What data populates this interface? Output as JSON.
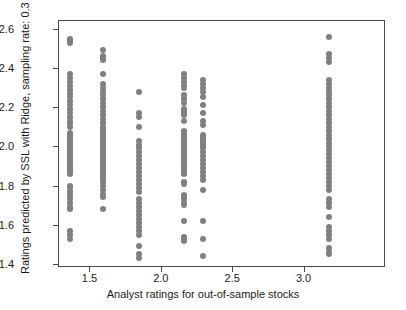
{
  "chart_data": {
    "type": "scatter",
    "title": "",
    "xlabel": "Analyst ratings for out-of-sample stocks",
    "ylabel": "Ratings predicted by SSL with Ridge, sampling rate: 0.3",
    "xlim": [
      1.28,
      3.57
    ],
    "ylim": [
      1.385,
      2.645
    ],
    "xticks": [
      1.5,
      2.0,
      2.5,
      3.0
    ],
    "xtick_labels": [
      "1.5",
      "2.0",
      "2.5",
      "3.0"
    ],
    "yticks": [
      1.4,
      1.6,
      1.8,
      2.0,
      2.2,
      2.4,
      2.6
    ],
    "ytick_labels": [
      "1.4",
      "1.6",
      "1.8",
      "2.0",
      "2.2",
      "2.4",
      "2.6"
    ],
    "grid": false,
    "legend": null,
    "marker_color": "#808080",
    "marker_size": 6,
    "series": [
      {
        "name": "predicted vs analyst rating",
        "points": [
          [
            1.36,
            2.555
          ],
          [
            1.36,
            2.545
          ],
          [
            1.36,
            2.535
          ],
          [
            1.36,
            2.375
          ],
          [
            1.36,
            2.355
          ],
          [
            1.36,
            2.335
          ],
          [
            1.36,
            2.315
          ],
          [
            1.36,
            2.295
          ],
          [
            1.36,
            2.275
          ],
          [
            1.36,
            2.255
          ],
          [
            1.36,
            2.235
          ],
          [
            1.36,
            2.215
          ],
          [
            1.36,
            2.195
          ],
          [
            1.36,
            2.175
          ],
          [
            1.36,
            2.155
          ],
          [
            1.36,
            2.135
          ],
          [
            1.36,
            2.125
          ],
          [
            1.36,
            2.105
          ],
          [
            1.36,
            2.075
          ],
          [
            1.36,
            2.065
          ],
          [
            1.36,
            2.055
          ],
          [
            1.36,
            2.045
          ],
          [
            1.36,
            2.035
          ],
          [
            1.36,
            2.025
          ],
          [
            1.36,
            2.015
          ],
          [
            1.36,
            2.005
          ],
          [
            1.36,
            1.995
          ],
          [
            1.36,
            1.985
          ],
          [
            1.36,
            1.975
          ],
          [
            1.36,
            1.965
          ],
          [
            1.36,
            1.955
          ],
          [
            1.36,
            1.945
          ],
          [
            1.36,
            1.935
          ],
          [
            1.36,
            1.925
          ],
          [
            1.36,
            1.915
          ],
          [
            1.36,
            1.905
          ],
          [
            1.36,
            1.895
          ],
          [
            1.36,
            1.885
          ],
          [
            1.36,
            1.875
          ],
          [
            1.36,
            1.865
          ],
          [
            1.36,
            1.805
          ],
          [
            1.36,
            1.795
          ],
          [
            1.36,
            1.775
          ],
          [
            1.36,
            1.755
          ],
          [
            1.36,
            1.735
          ],
          [
            1.36,
            1.715
          ],
          [
            1.36,
            1.695
          ],
          [
            1.36,
            1.685
          ],
          [
            1.36,
            1.575
          ],
          [
            1.36,
            1.555
          ],
          [
            1.36,
            1.535
          ],
          [
            1.585,
            2.495
          ],
          [
            1.585,
            2.465
          ],
          [
            1.585,
            2.455
          ],
          [
            1.585,
            2.445
          ],
          [
            1.585,
            2.375
          ],
          [
            1.585,
            2.325
          ],
          [
            1.585,
            2.305
          ],
          [
            1.585,
            2.285
          ],
          [
            1.585,
            2.265
          ],
          [
            1.585,
            2.245
          ],
          [
            1.585,
            2.225
          ],
          [
            1.585,
            2.205
          ],
          [
            1.585,
            2.185
          ],
          [
            1.585,
            2.165
          ],
          [
            1.585,
            2.145
          ],
          [
            1.585,
            2.125
          ],
          [
            1.585,
            2.105
          ],
          [
            1.585,
            2.095
          ],
          [
            1.585,
            2.085
          ],
          [
            1.585,
            2.075
          ],
          [
            1.585,
            2.065
          ],
          [
            1.585,
            2.055
          ],
          [
            1.585,
            2.045
          ],
          [
            1.585,
            2.035
          ],
          [
            1.585,
            2.025
          ],
          [
            1.585,
            2.015
          ],
          [
            1.585,
            2.005
          ],
          [
            1.585,
            1.995
          ],
          [
            1.585,
            1.985
          ],
          [
            1.585,
            1.975
          ],
          [
            1.585,
            1.965
          ],
          [
            1.585,
            1.955
          ],
          [
            1.585,
            1.945
          ],
          [
            1.585,
            1.935
          ],
          [
            1.585,
            1.925
          ],
          [
            1.585,
            1.915
          ],
          [
            1.585,
            1.905
          ],
          [
            1.585,
            1.895
          ],
          [
            1.585,
            1.885
          ],
          [
            1.585,
            1.875
          ],
          [
            1.585,
            1.865
          ],
          [
            1.585,
            1.855
          ],
          [
            1.585,
            1.845
          ],
          [
            1.585,
            1.835
          ],
          [
            1.585,
            1.825
          ],
          [
            1.585,
            1.805
          ],
          [
            1.585,
            1.785
          ],
          [
            1.585,
            1.765
          ],
          [
            1.585,
            1.745
          ],
          [
            1.585,
            1.685
          ],
          [
            1.84,
            2.285
          ],
          [
            1.84,
            2.175
          ],
          [
            1.84,
            2.155
          ],
          [
            1.84,
            2.105
          ],
          [
            1.84,
            2.035
          ],
          [
            1.84,
            2.015
          ],
          [
            1.84,
            1.995
          ],
          [
            1.84,
            1.975
          ],
          [
            1.84,
            1.955
          ],
          [
            1.84,
            1.935
          ],
          [
            1.84,
            1.915
          ],
          [
            1.84,
            1.895
          ],
          [
            1.84,
            1.875
          ],
          [
            1.84,
            1.855
          ],
          [
            1.84,
            1.835
          ],
          [
            1.84,
            1.815
          ],
          [
            1.84,
            1.795
          ],
          [
            1.84,
            1.775
          ],
          [
            1.84,
            1.735
          ],
          [
            1.84,
            1.715
          ],
          [
            1.84,
            1.695
          ],
          [
            1.84,
            1.675
          ],
          [
            1.84,
            1.655
          ],
          [
            1.84,
            1.635
          ],
          [
            1.84,
            1.615
          ],
          [
            1.84,
            1.595
          ],
          [
            1.84,
            1.575
          ],
          [
            1.84,
            1.555
          ],
          [
            1.84,
            1.495
          ],
          [
            1.84,
            1.455
          ],
          [
            1.84,
            1.435
          ],
          [
            2.155,
            2.375
          ],
          [
            2.155,
            2.355
          ],
          [
            2.155,
            2.335
          ],
          [
            2.155,
            2.315
          ],
          [
            2.155,
            2.305
          ],
          [
            2.155,
            2.265
          ],
          [
            2.155,
            2.245
          ],
          [
            2.155,
            2.225
          ],
          [
            2.155,
            2.195
          ],
          [
            2.155,
            2.185
          ],
          [
            2.155,
            2.175
          ],
          [
            2.155,
            2.165
          ],
          [
            2.155,
            2.135
          ],
          [
            2.155,
            2.085
          ],
          [
            2.155,
            2.075
          ],
          [
            2.155,
            2.065
          ],
          [
            2.155,
            2.055
          ],
          [
            2.155,
            2.045
          ],
          [
            2.155,
            2.035
          ],
          [
            2.155,
            2.025
          ],
          [
            2.155,
            2.015
          ],
          [
            2.155,
            2.005
          ],
          [
            2.155,
            1.995
          ],
          [
            2.155,
            1.985
          ],
          [
            2.155,
            1.975
          ],
          [
            2.155,
            1.965
          ],
          [
            2.155,
            1.955
          ],
          [
            2.155,
            1.945
          ],
          [
            2.155,
            1.935
          ],
          [
            2.155,
            1.925
          ],
          [
            2.155,
            1.915
          ],
          [
            2.155,
            1.905
          ],
          [
            2.155,
            1.895
          ],
          [
            2.155,
            1.885
          ],
          [
            2.155,
            1.875
          ],
          [
            2.155,
            1.865
          ],
          [
            2.155,
            1.825
          ],
          [
            2.155,
            1.815
          ],
          [
            2.155,
            1.755
          ],
          [
            2.155,
            1.745
          ],
          [
            2.155,
            1.735
          ],
          [
            2.155,
            1.715
          ],
          [
            2.155,
            1.705
          ],
          [
            2.155,
            1.625
          ],
          [
            2.155,
            1.545
          ],
          [
            2.155,
            1.535
          ],
          [
            2.155,
            1.525
          ],
          [
            2.29,
            2.345
          ],
          [
            2.29,
            2.325
          ],
          [
            2.29,
            2.305
          ],
          [
            2.29,
            2.285
          ],
          [
            2.29,
            2.255
          ],
          [
            2.29,
            2.215
          ],
          [
            2.29,
            2.175
          ],
          [
            2.29,
            2.135
          ],
          [
            2.29,
            2.115
          ],
          [
            2.29,
            2.065
          ],
          [
            2.29,
            2.055
          ],
          [
            2.29,
            2.045
          ],
          [
            2.29,
            2.035
          ],
          [
            2.29,
            2.025
          ],
          [
            2.29,
            2.015
          ],
          [
            2.29,
            2.005
          ],
          [
            2.29,
            1.995
          ],
          [
            2.29,
            1.975
          ],
          [
            2.29,
            1.955
          ],
          [
            2.29,
            1.935
          ],
          [
            2.29,
            1.915
          ],
          [
            2.29,
            1.895
          ],
          [
            2.29,
            1.875
          ],
          [
            2.29,
            1.855
          ],
          [
            2.29,
            1.835
          ],
          [
            2.29,
            1.785
          ],
          [
            2.29,
            1.625
          ],
          [
            2.29,
            1.535
          ],
          [
            2.29,
            1.445
          ],
          [
            3.17,
            2.565
          ],
          [
            3.17,
            2.475
          ],
          [
            3.17,
            2.455
          ],
          [
            3.17,
            2.435
          ],
          [
            3.17,
            2.345
          ],
          [
            3.17,
            2.325
          ],
          [
            3.17,
            2.305
          ],
          [
            3.17,
            2.285
          ],
          [
            3.17,
            2.265
          ],
          [
            3.17,
            2.245
          ],
          [
            3.17,
            2.225
          ],
          [
            3.17,
            2.205
          ],
          [
            3.17,
            2.185
          ],
          [
            3.17,
            2.165
          ],
          [
            3.17,
            2.145
          ],
          [
            3.17,
            2.125
          ],
          [
            3.17,
            2.105
          ],
          [
            3.17,
            2.085
          ],
          [
            3.17,
            2.065
          ],
          [
            3.17,
            2.045
          ],
          [
            3.17,
            2.025
          ],
          [
            3.17,
            2.005
          ],
          [
            3.17,
            1.985
          ],
          [
            3.17,
            1.965
          ],
          [
            3.17,
            1.945
          ],
          [
            3.17,
            1.925
          ],
          [
            3.17,
            1.905
          ],
          [
            3.17,
            1.885
          ],
          [
            3.17,
            1.865
          ],
          [
            3.17,
            1.845
          ],
          [
            3.17,
            1.825
          ],
          [
            3.17,
            1.805
          ],
          [
            3.17,
            1.785
          ],
          [
            3.17,
            1.735
          ],
          [
            3.17,
            1.715
          ],
          [
            3.17,
            1.695
          ],
          [
            3.17,
            1.645
          ],
          [
            3.17,
            1.595
          ],
          [
            3.17,
            1.575
          ],
          [
            3.17,
            1.555
          ],
          [
            3.17,
            1.535
          ],
          [
            3.17,
            1.485
          ],
          [
            3.17,
            1.465
          ],
          [
            3.17,
            1.455
          ]
        ]
      }
    ]
  }
}
